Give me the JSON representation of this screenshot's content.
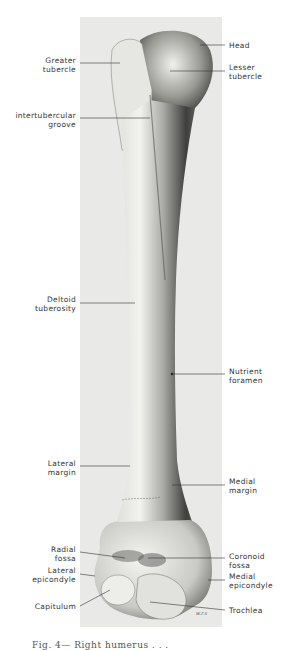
{
  "figure": {
    "caption_partial": "Fig. 4— Right humerus . . .",
    "artist_initials": "w.r.s"
  },
  "labels": {
    "left": [
      {
        "id": "greater-tubercle",
        "line1": "Greater",
        "line2": "tubercle",
        "y": 57,
        "pointer": [
          80,
          63,
          120,
          63
        ]
      },
      {
        "id": "intertubercular-groove",
        "line1": "intertubercular",
        "line2": "groove",
        "y": 112,
        "pointer": [
          80,
          118,
          150,
          118
        ]
      },
      {
        "id": "deltoid-tuberosity",
        "line1": "Deltoid",
        "line2": "tuberosity",
        "y": 296,
        "pointer": [
          80,
          303,
          135,
          303
        ]
      },
      {
        "id": "lateral-margin",
        "line1": "Lateral",
        "line2": "margin",
        "y": 460,
        "pointer": [
          80,
          466,
          130,
          466
        ]
      },
      {
        "id": "radial-fossa",
        "line1": "Radial",
        "line2": "fossa",
        "y": 546,
        "pointer": [
          80,
          552,
          125,
          558
        ]
      },
      {
        "id": "lateral-epicondyle",
        "line1": "Lateral",
        "line2": "epicondyle",
        "y": 567,
        "pointer": [
          80,
          574,
          95,
          576
        ]
      },
      {
        "id": "capitulum",
        "line1": "Capitulum",
        "line2": "",
        "y": 603,
        "pointer": [
          80,
          606,
          110,
          590
        ]
      }
    ],
    "right": [
      {
        "id": "head",
        "line1": "Head",
        "line2": "",
        "y": 42,
        "pointer": [
          200,
          45,
          225,
          45
        ]
      },
      {
        "id": "lesser-tubercle",
        "line1": "Lesser",
        "line2": "tubercle",
        "y": 64,
        "pointer": [
          170,
          71,
          225,
          71
        ]
      },
      {
        "id": "nutrient-foramen",
        "line1": "Nutrient",
        "line2": "foramen",
        "y": 368,
        "pointer": [
          172,
          374,
          225,
          374
        ]
      },
      {
        "id": "medial-margin",
        "line1": "Medial",
        "line2": "margin",
        "y": 478,
        "pointer": [
          172,
          485,
          225,
          485
        ]
      },
      {
        "id": "coronoid-fossa",
        "line1": "Coronoid",
        "line2": "fossa",
        "y": 553,
        "pointer": [
          148,
          558,
          225,
          558
        ]
      },
      {
        "id": "medial-epicondyle",
        "line1": "Medial",
        "line2": "epicondyle",
        "y": 573,
        "pointer": [
          208,
          580,
          225,
          580
        ]
      },
      {
        "id": "trochlea",
        "line1": "Trochlea",
        "line2": "",
        "y": 607,
        "pointer": [
          150,
          602,
          225,
          610
        ]
      }
    ]
  }
}
